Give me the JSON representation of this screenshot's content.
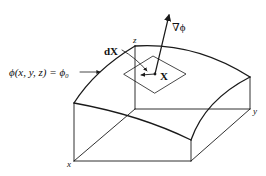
{
  "figure": {
    "labels": {
      "surface_equation": "ϕ(x, y, z) = ϕ₀",
      "gradient": "∇ϕ",
      "tangent": "dX",
      "point": "X",
      "axis_x": "x",
      "axis_y": "y",
      "axis_z": "z"
    },
    "colors": {
      "line": "#1a1a1a",
      "background": "#ffffff"
    }
  }
}
